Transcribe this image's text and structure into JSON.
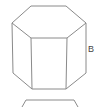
{
  "diagram": {
    "title": "",
    "shapes": [
      {
        "name": "hexagonal-prism",
        "top_face": [
          [
            31,
            6
          ],
          [
            66,
            6
          ],
          [
            86,
            23
          ],
          [
            67,
            38
          ],
          [
            31,
            38
          ],
          [
            12,
            23
          ]
        ],
        "bottom_visible": [
          [
            13,
            73
          ],
          [
            32,
            89
          ],
          [
            66,
            89
          ],
          [
            86,
            73
          ]
        ],
        "vertical_edges": [
          [
            12,
            23,
            13,
            73
          ],
          [
            31,
            38,
            32,
            89
          ],
          [
            67,
            38,
            66,
            89
          ],
          [
            86,
            23,
            86,
            73
          ]
        ]
      },
      {
        "name": "partial-shape-below",
        "top_edge": [
          [
            23,
            107
          ],
          [
            27,
            100
          ],
          [
            73,
            100
          ],
          [
            77,
            107
          ]
        ]
      }
    ],
    "labels": [
      {
        "text": "B",
        "x": 88,
        "y": 52
      }
    ],
    "stroke_color": "#8a8a8a",
    "label_color": "#444444"
  }
}
